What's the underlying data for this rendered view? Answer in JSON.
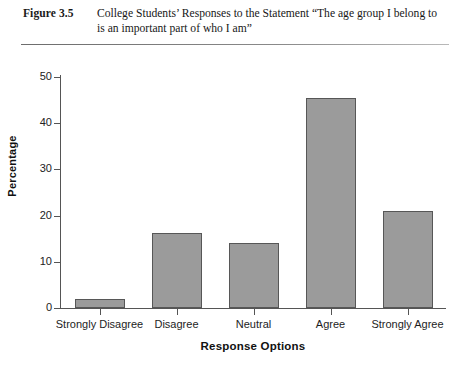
{
  "figure": {
    "number_label": "Figure 3.5",
    "caption": "College Students’ Responses to the Statement “The age group I belong to is an important part of who I am”"
  },
  "colors": {
    "bar_fill": "#9b9b9b",
    "bar_edge": "#575757",
    "axis": "#555555",
    "text": "#1a1a1a",
    "background": "#ffffff"
  },
  "chart_data": {
    "type": "bar",
    "title": "",
    "xlabel": "Response Options",
    "ylabel": "Percentage",
    "categories": [
      "Strongly Disagree",
      "Disagree",
      "Neutral",
      "Agree",
      "Strongly Agree"
    ],
    "values": [
      2,
      16.3,
      14,
      45.5,
      21
    ],
    "ylim": [
      0,
      50
    ],
    "yticks": [
      0,
      10,
      20,
      30,
      40,
      50
    ],
    "ytick_labels": [
      "0",
      "10",
      "20",
      "30",
      "40",
      "50"
    ],
    "grid": false,
    "legend": false
  }
}
